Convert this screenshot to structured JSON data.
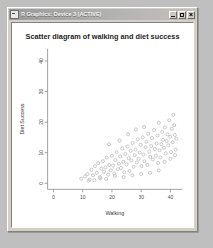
{
  "window": {
    "title": "R Graphics: Device 3 (ACTIVE)",
    "icon": "r-graphics-icon",
    "buttons": {
      "minimize": "_",
      "maximize": "□",
      "close": "×"
    }
  },
  "chart_data": {
    "type": "scatter",
    "title": "Scatter diagram of walking and diet success",
    "xlabel": "Walking",
    "ylabel": "Diet Success",
    "xlim": [
      -2,
      44
    ],
    "ylim": [
      -2,
      44
    ],
    "xticks": [
      0,
      10,
      20,
      30,
      40
    ],
    "yticks": [
      0,
      10,
      20,
      30,
      40
    ],
    "grid": false,
    "legend": null,
    "marker": "open-circle",
    "marker_color": "#b4b4b4",
    "points": [
      [
        9.5,
        1.5
      ],
      [
        10.8,
        2.2
      ],
      [
        11.6,
        3.0
      ],
      [
        12.4,
        1.2
      ],
      [
        13.0,
        4.4
      ],
      [
        13.5,
        2.6
      ],
      [
        14.2,
        5.6
      ],
      [
        14.8,
        3.4
      ],
      [
        15.3,
        6.6
      ],
      [
        15.9,
        2.0
      ],
      [
        16.4,
        4.8
      ],
      [
        16.9,
        7.2
      ],
      [
        17.3,
        3.8
      ],
      [
        17.8,
        5.2
      ],
      [
        18.2,
        8.4
      ],
      [
        18.7,
        2.8
      ],
      [
        19.1,
        6.0
      ],
      [
        19.6,
        4.2
      ],
      [
        20.0,
        9.0
      ],
      [
        20.4,
        5.8
      ],
      [
        20.8,
        3.2
      ],
      [
        21.2,
        7.6
      ],
      [
        21.6,
        10.2
      ],
      [
        22.0,
        4.6
      ],
      [
        22.4,
        6.4
      ],
      [
        22.8,
        8.8
      ],
      [
        23.1,
        5.0
      ],
      [
        23.5,
        11.4
      ],
      [
        23.9,
        7.0
      ],
      [
        24.2,
        3.6
      ],
      [
        24.6,
        9.6
      ],
      [
        25.0,
        6.2
      ],
      [
        25.3,
        12.0
      ],
      [
        25.7,
        8.2
      ],
      [
        26.0,
        4.0
      ],
      [
        26.4,
        10.6
      ],
      [
        26.7,
        7.4
      ],
      [
        27.1,
        13.2
      ],
      [
        27.4,
        5.4
      ],
      [
        27.8,
        9.2
      ],
      [
        28.1,
        11.0
      ],
      [
        28.5,
        6.8
      ],
      [
        28.8,
        14.4
      ],
      [
        29.1,
        8.0
      ],
      [
        29.5,
        10.0
      ],
      [
        29.8,
        12.6
      ],
      [
        30.1,
        5.6
      ],
      [
        30.5,
        15.0
      ],
      [
        30.8,
        9.4
      ],
      [
        31.1,
        7.2
      ],
      [
        31.5,
        11.8
      ],
      [
        31.8,
        13.6
      ],
      [
        32.1,
        6.0
      ],
      [
        32.4,
        16.2
      ],
      [
        32.8,
        10.4
      ],
      [
        33.1,
        8.6
      ],
      [
        33.4,
        12.2
      ],
      [
        33.7,
        14.8
      ],
      [
        34.0,
        7.8
      ],
      [
        34.4,
        17.4
      ],
      [
        34.7,
        11.2
      ],
      [
        35.0,
        9.0
      ],
      [
        35.3,
        13.0
      ],
      [
        35.6,
        15.6
      ],
      [
        36.0,
        19.8
      ],
      [
        36.3,
        10.8
      ],
      [
        36.6,
        8.4
      ],
      [
        36.9,
        12.8
      ],
      [
        37.2,
        16.8
      ],
      [
        37.5,
        14.2
      ],
      [
        37.8,
        11.6
      ],
      [
        38.1,
        18.2
      ],
      [
        38.4,
        9.8
      ],
      [
        38.7,
        13.8
      ],
      [
        39.0,
        16.0
      ],
      [
        39.3,
        12.4
      ],
      [
        39.6,
        20.6
      ],
      [
        39.9,
        15.2
      ],
      [
        40.2,
        10.2
      ],
      [
        40.5,
        17.8
      ],
      [
        40.8,
        13.4
      ],
      [
        41.0,
        22.4
      ],
      [
        41.3,
        19.0
      ],
      [
        41.5,
        15.8
      ],
      [
        41.8,
        11.0
      ],
      [
        12.0,
        0.8
      ],
      [
        14.0,
        1.0
      ],
      [
        16.0,
        1.6
      ],
      [
        18.0,
        1.4
      ],
      [
        21.0,
        2.4
      ],
      [
        24.0,
        2.0
      ],
      [
        27.0,
        2.6
      ],
      [
        30.0,
        3.0
      ],
      [
        33.0,
        3.4
      ],
      [
        36.0,
        4.2
      ],
      [
        19.0,
        12.8
      ],
      [
        22.6,
        14.0
      ],
      [
        25.5,
        16.0
      ],
      [
        28.2,
        17.6
      ],
      [
        31.0,
        18.4
      ],
      [
        35.8,
        6.6
      ],
      [
        38.0,
        7.0
      ],
      [
        40.0,
        8.0
      ],
      [
        41.6,
        9.2
      ],
      [
        42.0,
        14.6
      ]
    ]
  }
}
